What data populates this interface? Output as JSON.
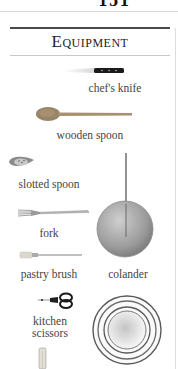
{
  "page": {
    "number": "151",
    "section_title": "Equipment"
  },
  "items": [
    {
      "id": "chefs-knife",
      "label": "chef's knife"
    },
    {
      "id": "wooden-spoon",
      "label": "wooden spoon"
    },
    {
      "id": "slotted-spoon",
      "label": "slotted spoon"
    },
    {
      "id": "fork",
      "label": "fork"
    },
    {
      "id": "colander",
      "label": "colander"
    },
    {
      "id": "pastry-brush",
      "label": "pastry brush"
    },
    {
      "id": "kitchen-scissors",
      "label_line1": "kitchen",
      "label_line2": "scissors"
    },
    {
      "id": "mixing-bowls",
      "label": ""
    },
    {
      "id": "rolling-pin",
      "label": ""
    }
  ],
  "colors": {
    "rule": "#4a4a4a",
    "wood": "#a89070",
    "steel": "#a0a0a0",
    "knife_handle": "#1a1a1a"
  }
}
